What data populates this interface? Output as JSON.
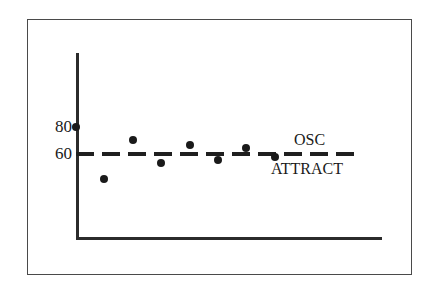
{
  "chart_data": {
    "type": "scatter",
    "title": "",
    "subtitle": "",
    "xlabel": "",
    "ylabel": "",
    "grid": false,
    "legend_position": "inline-annotations",
    "ylim": [
      0,
      100
    ],
    "xlim": [
      0,
      9
    ],
    "y_ticks": [
      {
        "value": 80,
        "label": "80"
      },
      {
        "value": 60,
        "label": "60"
      }
    ],
    "x_ticks": [],
    "series": [
      {
        "name": "OSC",
        "marker": "filled-circle",
        "x": [
          0,
          1,
          2,
          3,
          4,
          5,
          6,
          7
        ],
        "values": [
          80,
          40,
          70,
          52,
          66,
          55,
          64,
          57
        ]
      }
    ],
    "reference_lines": [
      {
        "name": "ATTRACT",
        "orientation": "horizontal",
        "value": 60,
        "style": "dashed",
        "label": "ATTRACT"
      }
    ],
    "annotations": [
      {
        "text": "OSC",
        "x": 7.0,
        "y": 68
      },
      {
        "text": "ATTRACT",
        "x": 6.3,
        "y": 52
      }
    ]
  },
  "labels": {
    "tick_80": "80",
    "tick_60": "60",
    "osc": "OSC",
    "attract": "ATTRACT"
  }
}
